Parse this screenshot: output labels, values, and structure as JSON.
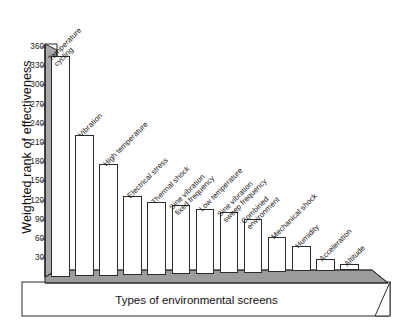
{
  "chart": {
    "type": "bar",
    "title": "",
    "xlabel": "Types of environmental screens",
    "ylabel": "Weighted rank of effectiveness"
  },
  "chart_data": {
    "type": "bar",
    "title": "",
    "subtitle": "",
    "xlabel": "Types of environmental screens",
    "ylabel": "Weighted rank of effectiveness",
    "ylim": [
      0,
      375
    ],
    "grid": false,
    "legend": false,
    "legend_position": "none",
    "yticks": [
      30,
      60,
      90,
      120,
      150,
      180,
      210,
      240,
      270,
      300,
      330,
      360
    ],
    "ytick_labels": [
      "30",
      "60",
      "90",
      "120",
      "150",
      "180",
      "210",
      "240",
      "270",
      "300",
      "330",
      "360"
    ],
    "categories": [
      "Temperature\ncycling",
      "Vibration",
      "High temperature",
      "Electrical stress",
      "Thermal shock",
      "Sine vibration\nfixed frequency",
      "Low temperature",
      "Sine vibration\nsweep frequency",
      "Combined\nenvironment",
      "Mechanical shock",
      "Humidity",
      "Acceleration",
      "Altitude"
    ],
    "values": [
      345,
      220,
      174,
      124,
      114,
      108,
      101,
      96,
      84,
      54,
      39,
      18,
      10
    ]
  },
  "axis": {
    "y_title": "Weighted rank of effectiveness",
    "x_title": "Types of environmental screens",
    "y_ticks": [
      "360",
      "330",
      "300",
      "270",
      "240",
      "210",
      "180",
      "150",
      "120",
      "90",
      "60",
      "30"
    ]
  },
  "labels": {
    "items": [
      {
        "line1": "Temperature",
        "line2": "cycling"
      },
      {
        "line1": "Vibration",
        "line2": ""
      },
      {
        "line1": "High temperature",
        "line2": ""
      },
      {
        "line1": "Electrical stress",
        "line2": ""
      },
      {
        "line1": "Thermal shock",
        "line2": ""
      },
      {
        "line1": "Sine vibration",
        "line2": "fixed frequency"
      },
      {
        "line1": "Low temperature",
        "line2": ""
      },
      {
        "line1": "Sine vibration",
        "line2": "sweep frequency"
      },
      {
        "line1": "Combined",
        "line2": "environment"
      },
      {
        "line1": "Mechanical shock",
        "line2": ""
      },
      {
        "line1": "Humidity",
        "line2": ""
      },
      {
        "line1": "Acceleration",
        "line2": ""
      },
      {
        "line1": "Altitude",
        "line2": ""
      }
    ]
  },
  "colors": {
    "bar_fill": "#ffffff",
    "bar_stroke": "#2b2b2b",
    "shade": "#a8a8a8",
    "floor": "#9c9c9c",
    "text": "#111111"
  }
}
